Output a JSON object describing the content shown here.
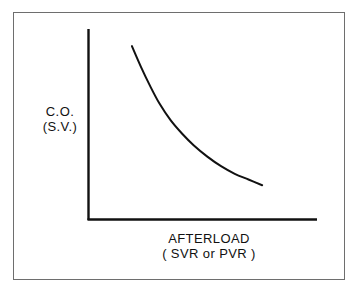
{
  "figure": {
    "background_color": "#ffffff",
    "frame_color": "#6e6e6e",
    "ink_color": "#111111"
  },
  "axes": {
    "y_label_line1": "C.O.",
    "y_label_line2": "(S.V.)",
    "x_label_line1": "AFTERLOAD",
    "x_label_line2": "( SVR or PVR )"
  },
  "chart_data": {
    "type": "line",
    "title": "",
    "subtitle": "",
    "xlabel": "AFTERLOAD ( SVR or PVR )",
    "ylabel": "C.O. (S.V.)",
    "xlim": [
      0,
      100
    ],
    "ylim": [
      0,
      100
    ],
    "grid": false,
    "legend": null,
    "axis_ticks": {
      "x": [],
      "y": []
    },
    "annotations": [],
    "series": [
      {
        "name": "Cardiac output vs afterload",
        "color": "#111111",
        "line_width": 2,
        "x": [
          19,
          23,
          27,
          31,
          36,
          41,
          46,
          52,
          58,
          64,
          70,
          76
        ],
        "y": [
          91,
          80,
          70,
          61,
          52,
          45,
          39,
          33,
          28,
          24,
          21,
          18
        ]
      }
    ]
  }
}
